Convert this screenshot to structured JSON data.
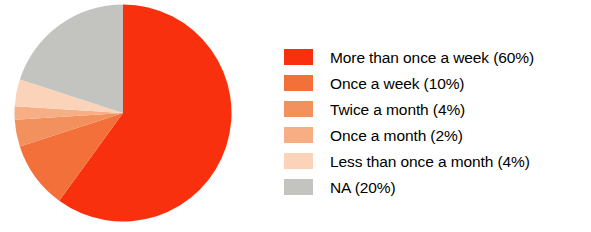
{
  "chart_data": {
    "type": "pie",
    "title": "",
    "labels": [
      "More than once a week",
      "Once a week",
      "Twice a month",
      "Once a month",
      "Less than once a month",
      "NA"
    ],
    "values": [
      60,
      10,
      4,
      2,
      4,
      20
    ],
    "value_unit": "%",
    "colors": [
      "#F8300D",
      "#F4703A",
      "#F2905E",
      "#F7AE85",
      "#FAD3B8",
      "#C3C4C0"
    ],
    "legend_position": "right",
    "start_angle_deg": 0,
    "direction": "clockwise",
    "grid": false,
    "legend_entries": [
      "More than once a week (60%)",
      "Once a week (10%)",
      "Twice a month (4%)",
      "Once a month (2%)",
      "Less than once a month (4%)",
      "NA (20%)"
    ]
  },
  "legend": {
    "rows": [
      {
        "label": "More than once a week (60%)",
        "color": "#F8300D",
        "name": "more-than-once-a-week"
      },
      {
        "label": "Once a week (10%)",
        "color": "#F4703A",
        "name": "once-a-week"
      },
      {
        "label": "Twice a month (4%)",
        "color": "#F2905E",
        "name": "twice-a-month"
      },
      {
        "label": "Once a month (2%)",
        "color": "#F7AE85",
        "name": "once-a-month"
      },
      {
        "label": "Less than once a month (4%)",
        "color": "#FAD3B8",
        "name": "less-than-once-a-month"
      },
      {
        "label": "NA (20%)",
        "color": "#C3C4C0",
        "name": "na"
      }
    ]
  }
}
